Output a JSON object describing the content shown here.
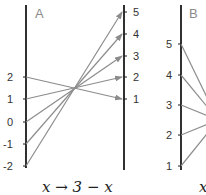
{
  "panels": [
    {
      "label": "A",
      "caption": "x → 3 − x",
      "left_axis": {
        "ticks": [
          "2",
          "1",
          "0",
          "-1",
          "-2"
        ]
      },
      "right_axis": {
        "ticks": [
          "5",
          "4",
          "3",
          "2",
          "1"
        ]
      },
      "mappings": [
        {
          "from": "2",
          "to": "1"
        },
        {
          "from": "1",
          "to": "2"
        },
        {
          "from": "0",
          "to": "3"
        },
        {
          "from": "-1",
          "to": "4"
        },
        {
          "from": "-2",
          "to": "5"
        }
      ]
    },
    {
      "label": "B",
      "caption": "x",
      "left_axis": {
        "ticks": [
          "5",
          "4",
          "3",
          "2",
          "1"
        ]
      }
    }
  ],
  "colors": {
    "axis": "#1a1a1a",
    "line": "#8c8c8c",
    "label": "#8a8a8a"
  }
}
